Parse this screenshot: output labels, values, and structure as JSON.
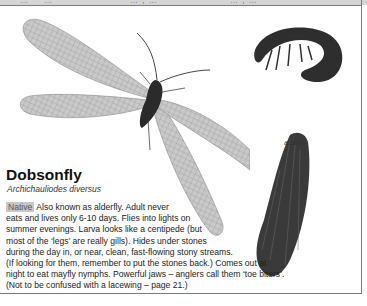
{
  "top_strip": {
    "fragments": [
      "… ‘  ’ …",
      "…  ,  …",
      "… ,  …"
    ]
  },
  "images": {
    "main_adult": {
      "alt": "Dobsonfly adult with wings spread"
    },
    "larva": {
      "label": "larva",
      "alt": "Dobsonfly larva curled"
    },
    "adults": {
      "label": "adults",
      "alt": "Dobsonfly adult with wings folded"
    }
  },
  "entry": {
    "title": "Dobsonfly",
    "latin_name": "Archichauliodes diversus",
    "badge": "Native",
    "lines": [
      " Also known as alderfly. Adult never",
      "eats and lives only 6-10 days. Flies into lights on",
      "summer evenings. Larva looks like a centipede (but",
      "most of the ‘legs’ are really gills). Hides under stones",
      "during the day in, or near, clean, fast-flowing stony streams.",
      "(If looking for them, remember to put the stones back.) Comes out at",
      "night to eat mayfly nymphs. Powerful jaws – anglers call them ‘toe biters’.",
      "(Not to be confused with a lacewing – page 21.)"
    ]
  },
  "colors": {
    "frame": "#7a7a7a",
    "badge_bg": "#c8c8c8",
    "text": "#222222"
  }
}
